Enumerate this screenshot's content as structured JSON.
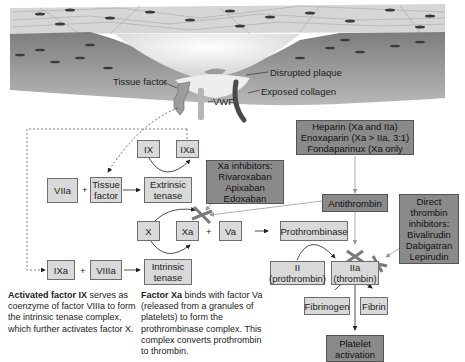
{
  "illustration": {
    "labels": {
      "tissue_factor": "Tissue factor",
      "disrupted_plaque": "Disrupted plaque",
      "exposed_collagen": "Exposed collagen",
      "vwf": "VWF"
    }
  },
  "nodes": {
    "ix": "IX",
    "ixa_top": "IXa",
    "viia": "VIIa",
    "tissue_factor": "Tissue factor",
    "extrinsic_tenase": "Extrinsic tenase",
    "x": "X",
    "xa": "Xa",
    "va": "Va",
    "prothrombinase": "Prothrombinase",
    "ixa_bottom": "IXa",
    "viiia": "VIIIa",
    "intrinsic_tenase": "Intrinsic tenase",
    "ii_line1": "II",
    "ii_line2": "(prothrombin)",
    "iia_line1": "IIa",
    "iia_line2": "(thrombin)",
    "fibrinogen": "Fibrinogen",
    "fibrin": "Fibrin",
    "platelet_line1": "Platelet",
    "platelet_line2": "activation",
    "antithrombin": "Antithrombin"
  },
  "operators": {
    "plus": "+"
  },
  "drug_boxes": {
    "heparins": [
      "Heparin (Xa and IIa)",
      "Enoxaparin (Xa > IIa, 3:1)",
      "Fondaparinux (Xa only"
    ],
    "xa_inhibitors": [
      "Xa inhibitors:",
      "Rivaroxaban",
      "Apixaban",
      "Edoxaban"
    ],
    "direct_thrombin": [
      "Direct",
      "thrombin",
      "inhibitors:",
      "Bivalirudin",
      "Dabigatran",
      "Lepirudin"
    ]
  },
  "notes": {
    "factor_ix": {
      "bold": "Activated factor IX",
      "text": " serves as coenzyme of factor VIIIa to form the intrinsic tenase complex, which further activates factor X."
    },
    "factor_xa": {
      "bold": "Factor Xa",
      "text": " binds with factor Va (released from a granules of platelets) to form the prothrombinase complex. This complex converts prothrombin to thrombin."
    }
  }
}
